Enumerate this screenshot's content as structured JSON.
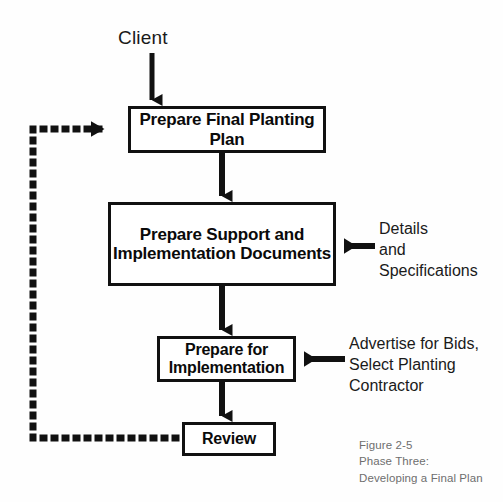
{
  "figure": {
    "title_lines": "Figure 2-5\nPhase Three:\nDeveloping a Final Plan",
    "background_color": "#ffffff",
    "ink_color": "#111111"
  },
  "nodes": {
    "client": "Client",
    "plan": "Prepare Final\nPlanting Plan",
    "support": "Prepare Support\nand\nImplementation Documents",
    "implementation": "Prepare for\nImplementation",
    "review": "Review"
  },
  "annotations": {
    "details": "Details\nand\nSpecifications",
    "advertise": "Advertise for Bids,\nSelect Planting\nContractor"
  },
  "connectors": [
    {
      "name": "client-to-plan",
      "style": "solid-arrow",
      "direction": "down"
    },
    {
      "name": "plan-to-support",
      "style": "solid-arrow",
      "direction": "down"
    },
    {
      "name": "support-to-implementation",
      "style": "solid-arrow",
      "direction": "down"
    },
    {
      "name": "implementation-to-review",
      "style": "solid-arrow",
      "direction": "down"
    },
    {
      "name": "details-to-support",
      "style": "solid-arrow",
      "direction": "left"
    },
    {
      "name": "advertise-to-implementation",
      "style": "solid-arrow",
      "direction": "left"
    },
    {
      "name": "review-feedback-to-plan",
      "style": "dotted-arrow",
      "direction": "up-right"
    }
  ]
}
